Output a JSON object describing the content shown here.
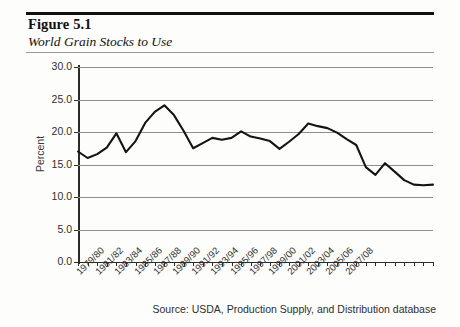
{
  "figure": {
    "number_label": "Figure 5.1",
    "title": "World Grain Stocks to Use",
    "source_note": "Source: USDA, Production Supply, and Distribution database"
  },
  "chart_data": {
    "type": "line",
    "title": "World Grain Stocks to Use",
    "xlabel": "",
    "ylabel": "Percent",
    "ylim": [
      0.0,
      30.0
    ],
    "ytick_labels": [
      "0.0",
      "5.0",
      "10.0",
      "15.0",
      "20.0",
      "25.0",
      "30.0"
    ],
    "ytick_values": [
      0.0,
      5.0,
      10.0,
      15.0,
      20.0,
      25.0,
      30.0
    ],
    "grid": "horizontal",
    "legend": "none",
    "line_color": "#141414",
    "categories": [
      "1979/80",
      "1980/81",
      "1981/82",
      "1982/83",
      "1983/84",
      "1984/85",
      "1985/86",
      "1986/87",
      "1987/88",
      "1988/89",
      "1989/90",
      "1990/91",
      "1991/92",
      "1992/93",
      "1993/94",
      "1994/95",
      "1995/96",
      "1996/97",
      "1997/98",
      "1998/99",
      "1999/00",
      "2000/01",
      "2001/02",
      "2002/03",
      "2003/04",
      "2004/05",
      "2005/06",
      "2006/07",
      "2007/08",
      "2008/09"
    ],
    "xtick_labels": [
      "1979/80",
      "1981/82",
      "1983/84",
      "1985/86",
      "1987/88",
      "1989/90",
      "1991/92",
      "1993/94",
      "1995/96",
      "1997/98",
      "1999/00",
      "2001/02",
      "2003/04",
      "2005/06",
      "2007/08"
    ],
    "values": [
      17.0,
      16.0,
      16.6,
      17.6,
      19.8,
      16.9,
      18.6,
      21.4,
      23.1,
      24.1,
      22.6,
      20.2,
      17.5,
      18.3,
      19.1,
      18.8,
      19.1,
      20.1,
      19.3,
      19.0,
      18.6,
      17.4,
      18.5,
      19.7,
      21.3,
      20.9,
      20.6,
      19.9,
      18.9,
      18.0
    ],
    "values_tail": [
      14.6,
      13.4,
      15.2,
      13.9,
      12.6,
      11.9,
      11.8,
      11.9
    ],
    "peak": {
      "category": "1988/89",
      "value": 24.1
    },
    "trough_recent": {
      "category": "2007/08",
      "value": 11.8
    }
  }
}
